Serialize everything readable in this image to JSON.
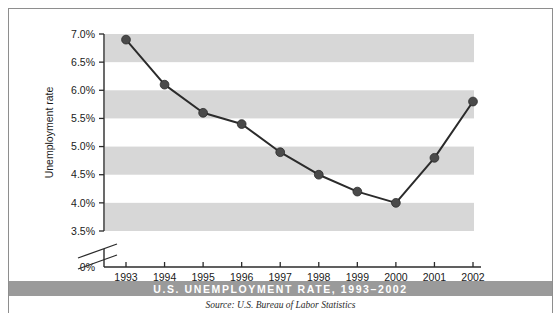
{
  "figure": {
    "title": "U.S. UNEMPLOYMENT RATE, 1993–2002",
    "source": "Source: U.S. Bureau of Labor Statistics"
  },
  "chart_data": {
    "type": "line",
    "title": "U.S. UNEMPLOYMENT RATE, 1993–2002",
    "subtitle": "",
    "xlabel": "",
    "ylabel": "Unemployment rate",
    "categories": [
      "1993",
      "1994",
      "1995",
      "1996",
      "1997",
      "1998",
      "1999",
      "2000",
      "2001",
      "2002"
    ],
    "values": [
      6.9,
      6.1,
      5.6,
      5.4,
      4.9,
      4.5,
      4.2,
      4.0,
      4.8,
      5.8
    ],
    "value_unit": "%",
    "ylim": [
      3.5,
      7.0
    ],
    "y_axis_broken": true,
    "y_break_between": [
      0,
      3.5
    ],
    "yticks": [
      "0%",
      "3.5%",
      "4.0%",
      "4.5%",
      "5.0%",
      "5.5%",
      "6.0%",
      "6.5%",
      "7.0%"
    ],
    "ytick_values": [
      0,
      3.5,
      4.0,
      4.5,
      5.0,
      5.5,
      6.0,
      6.5,
      7.0
    ],
    "xticks": [
      "1993",
      "1994",
      "1995",
      "1996",
      "1997",
      "1998",
      "1999",
      "2000",
      "2001",
      "2002"
    ],
    "grid": false,
    "banded_background": true,
    "legend": null,
    "legend_position": "none",
    "colors": {
      "line": "#2b2b2b",
      "marker": "#4a4a4a",
      "band": "#d7d7d7",
      "title_band": "#9a9a9a",
      "title_text": "#ffffff",
      "axis": "#2b2b2b",
      "frame": "#8e8e8e"
    }
  }
}
